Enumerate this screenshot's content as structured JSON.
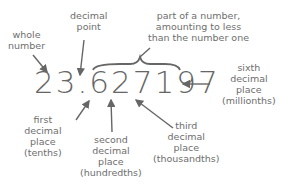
{
  "diagram": {
    "number": "23.627197",
    "whole_part": "23",
    "decimal_point": ".",
    "fractional_part": "627197",
    "labels": {
      "whole_number": "whole\nnumber",
      "decimal_point": "decimal\npoint",
      "fractional_part": "part of a number,\namounting to less\nthan the number one",
      "sixth": "sixth\ndecimal\nplace\n(millionths)",
      "first": "first\ndecimal\nplace\n(tenths)",
      "second": "second\ndecimal\nplace\n(hundredths)",
      "third": "third\ndecimal\nplace\n(thousandths)"
    }
  }
}
